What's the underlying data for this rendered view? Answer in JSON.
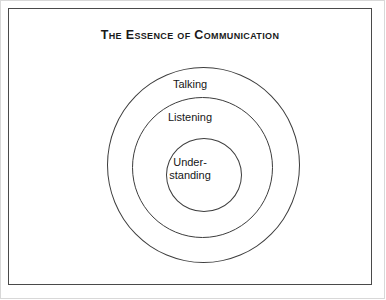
{
  "figure": {
    "title": "The Essence of Communication",
    "background_color": "#ffffff",
    "line_color": "#3d3d3d",
    "text_color": "#161616"
  },
  "diagram": {
    "type": "concentric-circles",
    "rings": [
      {
        "name": "outer-ring",
        "label": "Talking"
      },
      {
        "name": "middle-ring",
        "label": "Listening"
      },
      {
        "name": "inner-circle",
        "label_line1": "Under-",
        "label_line2": "standing"
      }
    ]
  }
}
